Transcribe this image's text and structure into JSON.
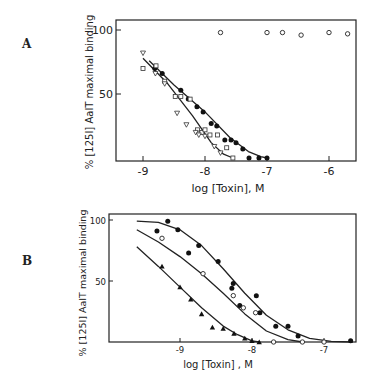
{
  "chart_data": [
    {
      "panel": "A",
      "type": "scatter",
      "title": "",
      "xlabel": "log [Toxin], M",
      "ylabel": "% [125I] AaIT maximal binding",
      "xlim": [
        -9.45,
        -5.6
      ],
      "ylim": [
        0,
        108
      ],
      "xticks": [
        -9,
        -8,
        -7,
        -6
      ],
      "xtick_labels": [
        "-9",
        "-8",
        "-7",
        "-6"
      ],
      "yticks": [
        50,
        100
      ],
      "ytick_labels": [
        "50",
        "100"
      ],
      "grid": false,
      "legend": null,
      "series": [
        {
          "name": "filled circles",
          "marker": "filled-circle",
          "x": [
            -8.81,
            -8.69,
            -8.39,
            -8.27,
            -8.13,
            -8.03,
            -7.9,
            -7.81,
            -7.68,
            -7.58,
            -7.5,
            -7.39,
            -7.29,
            -7.13,
            -7.0
          ],
          "y": [
            70,
            66,
            53,
            46,
            40,
            36,
            27,
            25,
            14,
            14,
            12,
            7,
            0,
            0,
            0
          ]
        },
        {
          "name": "open squares",
          "marker": "open-square",
          "x": [
            -9.0,
            -8.79,
            -8.65,
            -8.48,
            -8.39,
            -8.24,
            -8.12,
            -8.05,
            -8.0,
            -7.92,
            -7.8,
            -7.65,
            -7.55
          ],
          "y": [
            70,
            72,
            60,
            48,
            48,
            46,
            22,
            20,
            22,
            18,
            18,
            8,
            0
          ]
        },
        {
          "name": "open triangles",
          "marker": "open-triangle",
          "x": [
            -9.0,
            -8.8,
            -8.65,
            -8.45,
            -8.3,
            -8.15,
            -8.1,
            -8.0,
            -7.85,
            -7.75
          ],
          "y": [
            82,
            66,
            58,
            35,
            26,
            20,
            18,
            17,
            9,
            4
          ]
        },
        {
          "name": "open circles (no displacement)",
          "marker": "open-circle",
          "x": [
            -7.75,
            -7.0,
            -6.75,
            -6.45,
            -6.0,
            -5.7
          ],
          "y": [
            98,
            98,
            98,
            96,
            98,
            97
          ]
        }
      ],
      "curves": [
        {
          "name": "fit filled circles",
          "x": [
            -8.9,
            -8.5,
            -8.0,
            -7.6,
            -7.3,
            -7.1,
            -7.0
          ],
          "y": [
            76,
            57,
            36,
            16,
            5,
            1,
            0
          ]
        },
        {
          "name": "fit open symbols",
          "x": [
            -9.0,
            -8.6,
            -8.2,
            -7.9,
            -7.7,
            -7.55
          ],
          "y": [
            78,
            58,
            33,
            12,
            3,
            0
          ]
        }
      ]
    },
    {
      "panel": "B",
      "type": "scatter",
      "title": "",
      "xlabel": "log [Toxin], M",
      "ylabel": "% [125I] AaIT maximal binding",
      "xlim": [
        -9.98,
        -6.55
      ],
      "ylim": [
        0,
        105
      ],
      "xticks": [
        -9,
        -8,
        -7
      ],
      "xtick_labels": [
        "-9",
        "-8",
        "-7"
      ],
      "yticks": [
        50,
        100
      ],
      "ytick_labels": [
        "50",
        "100"
      ],
      "grid": false,
      "legend": null,
      "series": [
        {
          "name": "filled circles",
          "marker": "filled-circle",
          "x": [
            -9.32,
            -9.17,
            -9.03,
            -8.88,
            -8.74,
            -8.47,
            -8.28,
            -8.26,
            -8.17,
            -7.94,
            -7.89,
            -7.67,
            -7.5,
            -7.36,
            -6.63
          ],
          "y": [
            91,
            99,
            92,
            73,
            79,
            66,
            44,
            48,
            30,
            38,
            24,
            13,
            13,
            5,
            1
          ]
        },
        {
          "name": "open circles",
          "marker": "open-circle",
          "x": [
            -9.25,
            -8.68,
            -8.26,
            -8.12,
            -7.95,
            -7.7,
            -7.3,
            -7.0
          ],
          "y": [
            85,
            56,
            38,
            28,
            24,
            0,
            0,
            0
          ]
        },
        {
          "name": "filled triangles",
          "marker": "filled-triangle",
          "x": [
            -9.25,
            -9.0,
            -8.85,
            -8.7,
            -8.55,
            -8.4,
            -8.25,
            -8.1,
            -8.0,
            -7.9
          ],
          "y": [
            62,
            45,
            35,
            23,
            12,
            11,
            7,
            3,
            1,
            0
          ]
        }
      ],
      "curves": [
        {
          "name": "fit filled circles",
          "x": [
            -9.6,
            -9.3,
            -9.0,
            -8.7,
            -8.4,
            -8.1,
            -7.8,
            -7.5,
            -7.2,
            -6.9,
            -6.6
          ],
          "y": [
            99,
            98,
            92,
            79,
            60,
            40,
            22,
            10,
            3,
            0.5,
            0
          ]
        },
        {
          "name": "fit open circles",
          "x": [
            -9.6,
            -9.3,
            -9.0,
            -8.7,
            -8.4,
            -8.1,
            -7.8,
            -7.5,
            -7.3
          ],
          "y": [
            92,
            82,
            70,
            56,
            40,
            23,
            9,
            2,
            0
          ]
        },
        {
          "name": "fit filled triangles",
          "x": [
            -9.6,
            -9.3,
            -9.0,
            -8.7,
            -8.4,
            -8.2,
            -8.0,
            -7.9
          ],
          "y": [
            78,
            62,
            45,
            28,
            13,
            6,
            1,
            0
          ]
        }
      ]
    }
  ],
  "panels": {
    "A": {
      "label": "A",
      "xlabel": "log [Toxin], M",
      "ylabel": "% [125I] AaIT maximal binding"
    },
    "B": {
      "label": "B",
      "xlabel": "log   [Toxin] , M",
      "ylabel": "% [125I] AaIT maximal binding"
    }
  }
}
